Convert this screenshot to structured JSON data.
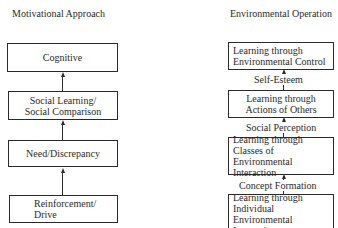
{
  "cut_text": "EVIRONMENTAL ...",
  "left_column": {
    "title": "Motivational Approach",
    "boxes": [
      {
        "lines": [
          "Cognitive"
        ]
      },
      {
        "lines": [
          "Social Learning/",
          "Social Comparison"
        ]
      },
      {
        "lines": [
          "Need/Discrepancy"
        ]
      },
      {
        "lines": [
          "Reinforcement/",
          "Drive"
        ]
      }
    ]
  },
  "right_column": {
    "title": "Environmental Operation",
    "boxes": [
      {
        "lines": [
          "Learning through",
          "Environmental Control"
        ]
      },
      {
        "lines": [
          "Learning through",
          "Actions of Others"
        ]
      },
      {
        "lines": [
          "Learning through",
          "Classes of Environmental",
          "Interaction"
        ]
      },
      {
        "lines": [
          "Learning through",
          "Individual Environmental",
          "Interactions"
        ]
      }
    ],
    "connectors": [
      "Self-Esteem",
      "Social Perception",
      "Concept Formation"
    ]
  }
}
